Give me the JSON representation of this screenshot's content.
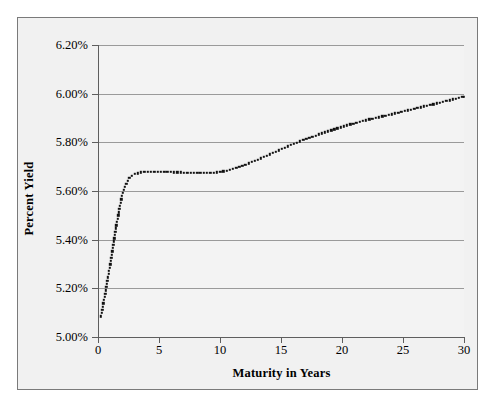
{
  "chart_data": {
    "type": "line",
    "title": "",
    "xlabel": "Maturity in Years",
    "ylabel": "Percent Yield",
    "xlim": [
      0,
      30
    ],
    "ylim": [
      5.0,
      6.2
    ],
    "grid": true,
    "legend": null,
    "x_ticks": [
      "0",
      "5",
      "10",
      "15",
      "20",
      "25",
      "30"
    ],
    "x_tick_values": [
      0,
      5,
      10,
      15,
      20,
      25,
      30
    ],
    "y_ticks": [
      "5.00%",
      "5.20%",
      "5.40%",
      "5.60%",
      "5.80%",
      "6.00%",
      "6.20%"
    ],
    "y_tick_values": [
      5.0,
      5.2,
      5.4,
      5.6,
      5.8,
      6.0,
      6.2
    ],
    "series": [
      {
        "name": "Yield Curve",
        "style": "dotted",
        "color": "#111111",
        "x": [
          0.25,
          0.5,
          0.75,
          1.0,
          1.25,
          1.5,
          1.75,
          2.0,
          2.25,
          2.5,
          2.75,
          3.0,
          3.5,
          4.0,
          4.5,
          5.0,
          5.5,
          6.0,
          6.5,
          7.0,
          7.5,
          8.0,
          8.5,
          9.0,
          9.5,
          10.0,
          10.5,
          11.0,
          11.5,
          12.0,
          12.5,
          13.0,
          13.5,
          14.0,
          14.5,
          15.0,
          15.5,
          16.0,
          16.5,
          17.0,
          17.5,
          18.0,
          18.5,
          19.0,
          19.5,
          20.0,
          20.5,
          21.0,
          21.5,
          22.0,
          22.5,
          23.0,
          23.5,
          24.0,
          24.5,
          25.0,
          25.5,
          26.0,
          26.5,
          27.0,
          27.5,
          28.0,
          28.5,
          29.0,
          29.5,
          30.0
        ],
        "y": [
          5.085,
          5.155,
          5.225,
          5.3,
          5.38,
          5.455,
          5.525,
          5.585,
          5.625,
          5.65,
          5.663,
          5.67,
          5.676,
          5.679,
          5.68,
          5.68,
          5.679,
          5.678,
          5.677,
          5.676,
          5.675,
          5.674,
          5.674,
          5.674,
          5.675,
          5.678,
          5.683,
          5.69,
          5.698,
          5.707,
          5.717,
          5.727,
          5.738,
          5.749,
          5.76,
          5.771,
          5.782,
          5.793,
          5.803,
          5.813,
          5.822,
          5.831,
          5.84,
          5.848,
          5.856,
          5.864,
          5.871,
          5.878,
          5.885,
          5.891,
          5.897,
          5.903,
          5.909,
          5.915,
          5.921,
          5.927,
          5.933,
          5.939,
          5.945,
          5.951,
          5.957,
          5.963,
          5.969,
          5.975,
          5.982,
          5.988
        ]
      }
    ]
  }
}
